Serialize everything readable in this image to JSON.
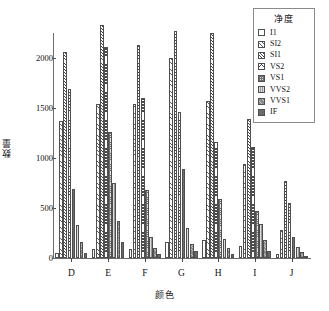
{
  "chart_data": {
    "type": "bar",
    "title": "",
    "xlabel": "颜色",
    "ylabel": "数量",
    "categories": [
      "D",
      "E",
      "F",
      "G",
      "H",
      "I",
      "J"
    ],
    "ylim": [
      0,
      2250
    ],
    "yticks": [
      0,
      500,
      1000,
      1500,
      2000
    ],
    "ytick_labels": [
      "0",
      "500",
      "1000",
      "1500",
      "2000"
    ],
    "grid": false,
    "legend_position": "top-right",
    "legend_title": "净度",
    "series": [
      {
        "name": "I1",
        "pattern": "p0",
        "values": [
          50,
          90,
          95,
          160,
          180,
          120,
          40
        ]
      },
      {
        "name": "SI2",
        "pattern": "p1",
        "values": [
          1370,
          1540,
          1545,
          2005,
          1570,
          940,
          280
        ]
      },
      {
        "name": "SI1",
        "pattern": "p2",
        "values": [
          2060,
          2330,
          2135,
          2270,
          2250,
          1390,
          770
        ]
      },
      {
        "name": "VS2",
        "pattern": "p3",
        "values": [
          1690,
          2110,
          1600,
          1460,
          1160,
          1110,
          555
        ]
      },
      {
        "name": "VS1",
        "pattern": "p4",
        "values": [
          690,
          1265,
          680,
          890,
          595,
          470,
          215
        ]
      },
      {
        "name": "VVS2",
        "pattern": "p5",
        "values": [
          330,
          750,
          210,
          300,
          190,
          345,
          110
        ]
      },
      {
        "name": "VVS1",
        "pattern": "p6",
        "values": [
          160,
          375,
          100,
          145,
          100,
          185,
          60
        ]
      },
      {
        "name": "IF",
        "pattern": "p7",
        "values": [
          55,
          160,
          45,
          70,
          45,
          70,
          25
        ]
      }
    ]
  }
}
